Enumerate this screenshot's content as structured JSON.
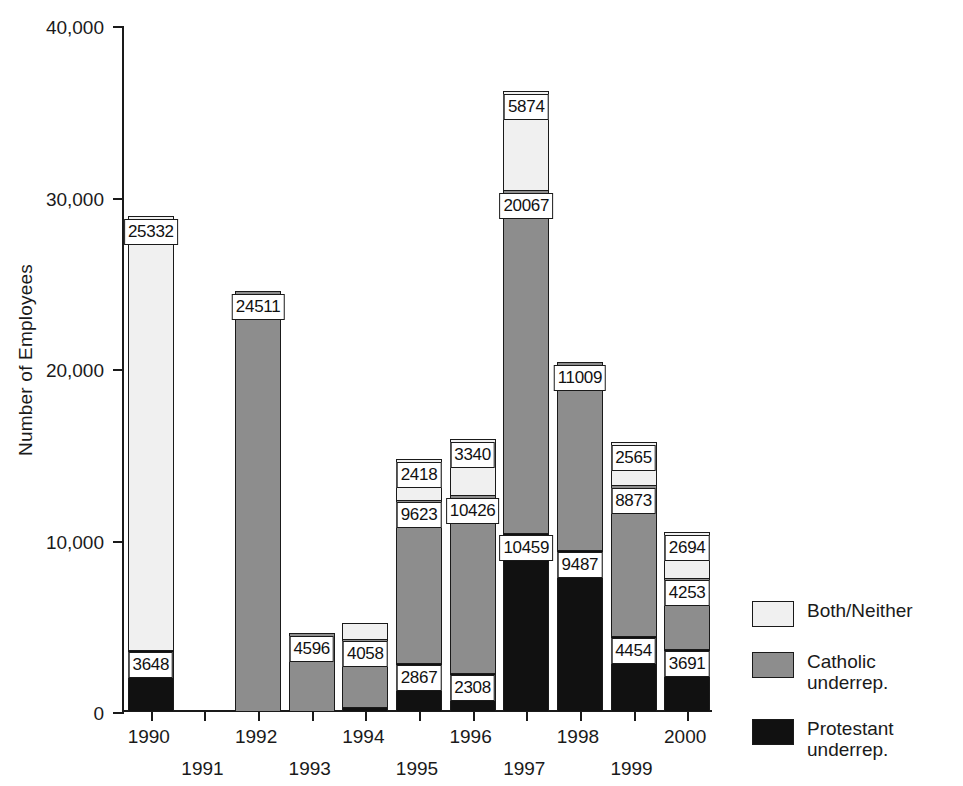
{
  "chart_data": {
    "type": "bar",
    "subtype": "stacked-vertical",
    "title": "",
    "xlabel": "",
    "ylabel": "Number of Employees",
    "ylim": [
      0,
      40000
    ],
    "yticks": [
      0,
      10000,
      20000,
      30000,
      40000
    ],
    "ytick_labels": [
      "0",
      "10,000",
      "20,000",
      "30,000",
      "40,000"
    ],
    "grid": false,
    "legend_position": "right",
    "categories": [
      "1990",
      "1991",
      "1992",
      "1993",
      "1994",
      "1995",
      "1996",
      "1997",
      "1998",
      "1999",
      "2000"
    ],
    "series": [
      {
        "name": "Protestant underrep.",
        "color": "#111111",
        "values": [
          3648,
          0,
          0,
          0,
          300,
          2867,
          2308,
          10459,
          9487,
          4454,
          3691
        ],
        "labels": [
          "3648",
          "",
          "",
          "",
          "",
          "2867",
          "2308",
          "10459",
          "9487",
          "4454",
          "3691"
        ]
      },
      {
        "name": "Catholic underrep.",
        "color": "#8d8d8d",
        "values": [
          0,
          0,
          24511,
          4596,
          4058,
          9623,
          10426,
          20067,
          11009,
          8873,
          4253
        ],
        "labels": [
          "",
          "",
          "24511",
          "4596",
          "4058",
          "9623",
          "10426",
          "20067",
          "11009",
          "8873",
          "4253"
        ]
      },
      {
        "name": "Both/Neither",
        "color": "#f0f0f0",
        "values": [
          25332,
          0,
          0,
          0,
          1000,
          2418,
          3340,
          5874,
          0,
          2565,
          2694
        ],
        "labels": [
          "25332",
          "",
          "",
          "",
          "",
          "2418",
          "3340",
          "5874",
          "",
          "2565",
          "2694"
        ]
      }
    ],
    "bar_totals": [
      28980,
      0,
      24511,
      4596,
      5358,
      14908,
      16074,
      36400,
      20496,
      15892,
      10638
    ],
    "data_labels_shown": true
  },
  "legend": {
    "items": [
      {
        "label": "Both/Neither",
        "swatch": "both",
        "color": "#f0f0f0"
      },
      {
        "label": "Catholic underrep.",
        "swatch": "cath",
        "color": "#8d8d8d"
      },
      {
        "label": "Protestant underrep.",
        "swatch": "prot",
        "color": "#111111"
      }
    ]
  },
  "axis": {
    "y_title": "Number of Employees"
  }
}
